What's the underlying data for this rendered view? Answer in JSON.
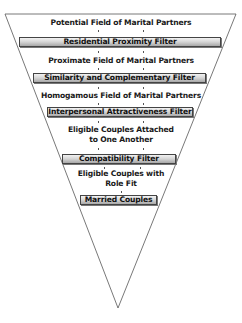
{
  "diagram": {
    "type": "funnel",
    "stages": [
      {
        "label": "Potential Field of Marital Partners"
      },
      {
        "filter": "Residential Proximity Filter"
      },
      {
        "label": "Proximate Field of Marital Partners"
      },
      {
        "filter": "Similarity and Complementary Filter"
      },
      {
        "label": "Homogamous Field of Marital Partners"
      },
      {
        "filter": "Interpersonal Attractiveness Filter"
      },
      {
        "label_line1": "Eligible Couples Attached",
        "label_line2": "to One Another"
      },
      {
        "filter": "Compatibility Filter"
      },
      {
        "label_line1": "Eligible Couples with",
        "label_line2": "Role Fit"
      },
      {
        "filter": "Married Couples"
      }
    ],
    "colors": {
      "outline": "#444444",
      "filter_fill_top": "#f2f2f2",
      "filter_fill_bottom": "#a8a8a8",
      "text": "#1a1a1a"
    }
  }
}
